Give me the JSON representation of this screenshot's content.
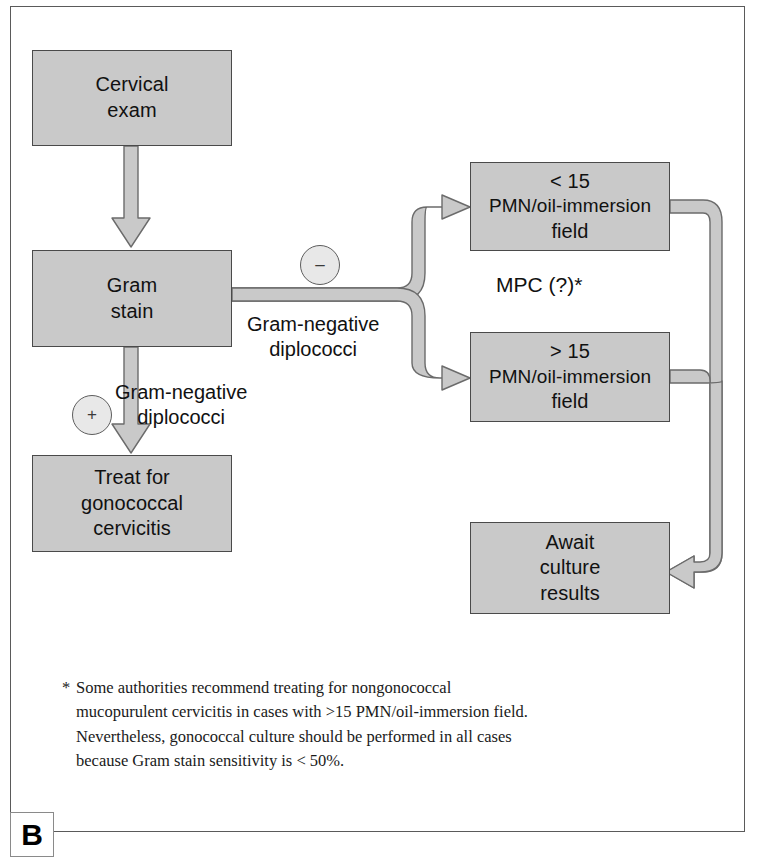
{
  "figure": {
    "panel_label": "B",
    "frame_color": "#5a5a5a",
    "node_fill": "#c9c9c9",
    "node_border": "#4a4a4a",
    "connector_fill": "#c9c9c9",
    "connector_stroke": "#6b6b6b"
  },
  "nodes": {
    "cervical_exam": {
      "line1": "Cervical",
      "line2": "exam"
    },
    "gram_stain": {
      "line1": "Gram",
      "line2": "stain"
    },
    "treat": {
      "line1": "Treat for",
      "line2": "gonococcal",
      "line3": "cervicitis"
    },
    "lt15": {
      "line1": "< 15",
      "line2": "PMN/oil-immersion",
      "line3": "field"
    },
    "gt15": {
      "line1": "> 15",
      "line2": "PMN/oil-immersion",
      "line3": "field"
    },
    "await_culture": {
      "line1": "Await",
      "line2": "culture",
      "line3": "results"
    }
  },
  "signs": {
    "minus": "–",
    "plus": "+"
  },
  "edge_labels": {
    "gram_negative_right": {
      "line1": "Gram-negative",
      "line2": "diplococci"
    },
    "gram_negative_left": {
      "line1": "Gram-negative",
      "line2": "diplococci"
    },
    "mpc": "MPC (?)*"
  },
  "footnote": {
    "marker": "*",
    "line1": "Some authorities recommend treating for nongonococcal",
    "line2": "mucopurulent cervicitis in cases with >15 PMN/oil-immersion field.",
    "line3": "Nevertheless, gonococcal culture should be performed in all cases",
    "line4": "because Gram stain sensitivity is < 50%."
  }
}
